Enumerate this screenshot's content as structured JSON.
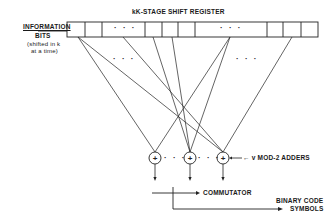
{
  "diagram": {
    "title": "kK-STAGE SHIFT REGISTER",
    "input_label": {
      "line1": "INFORMATION",
      "line2": "BITS",
      "line3": "(shifted in k",
      "line4": "at a time)"
    },
    "register": {
      "cells_x": [
        67,
        85,
        102,
        145,
        162,
        178,
        195,
        267,
        283,
        301,
        318
      ],
      "y_top": 22,
      "y_bottom": 37,
      "ellipsis": "· · ·"
    },
    "mid_ellipsis": "· · ·",
    "adders": {
      "label": "← v MOD-2 ADDERS",
      "symbol": "+",
      "between": "· · ·",
      "centers": [
        [
          155,
          158
        ],
        [
          190,
          158
        ],
        [
          223,
          158
        ]
      ],
      "radius": 6
    },
    "connections": [
      {
        "from_x": 78,
        "to_adder": 0
      },
      {
        "from_x": 78,
        "to_adder": 2
      },
      {
        "from_x": 123,
        "to_adder": 2
      },
      {
        "from_x": 153,
        "to_adder": 1
      },
      {
        "from_x": 172,
        "to_adder": 1
      },
      {
        "from_x": 230,
        "to_adder": 0
      },
      {
        "from_x": 230,
        "to_adder": 1
      },
      {
        "from_x": 292,
        "to_adder": 2
      }
    ],
    "commutator_label": "COMMUTATOR",
    "output_label": {
      "line1": "BINARY CODE",
      "line2": "SYMBOLS"
    }
  }
}
